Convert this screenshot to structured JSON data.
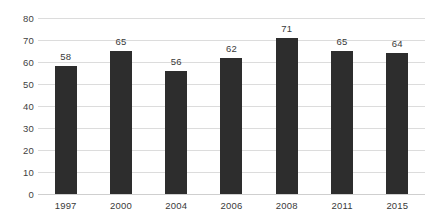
{
  "title_remnant": "",
  "colors": {
    "bar": "#2d2d2d",
    "gridline": "#dcdcdc",
    "axis_text": "#3a3a3a",
    "background": "#ffffff"
  },
  "chart_data": {
    "type": "bar",
    "title": "",
    "subtitle": "",
    "xlabel": "",
    "ylabel": "",
    "categories": [
      "1997",
      "2000",
      "2004",
      "2006",
      "2008",
      "2011",
      "2015"
    ],
    "values": [
      58,
      65,
      56,
      62,
      71,
      65,
      64
    ],
    "series": [
      {
        "name": "",
        "values": [
          58,
          65,
          56,
          62,
          71,
          65,
          64
        ]
      }
    ],
    "data_labels": [
      "58",
      "65",
      "56",
      "62",
      "71",
      "65",
      "64"
    ],
    "data_labels_shown": true,
    "ylim": [
      0,
      80
    ],
    "ytick_step": 10,
    "yticks": [
      0,
      10,
      20,
      30,
      40,
      50,
      60,
      70,
      80
    ],
    "ytick_labels": [
      "0",
      "10",
      "20",
      "30",
      "40",
      "50",
      "60",
      "70",
      "80"
    ],
    "grid": {
      "horizontal": true,
      "vertical": false
    },
    "legend": {
      "shown": false,
      "position": "none",
      "entries": []
    },
    "bar_color": "#2d2d2d",
    "orientation": "vertical"
  }
}
